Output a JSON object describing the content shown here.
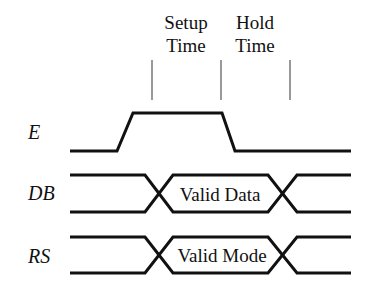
{
  "diagram": {
    "type": "timing-diagram",
    "colors": {
      "line": "#111111",
      "marker": "#555555",
      "background": "#ffffff"
    },
    "headers": {
      "setup": {
        "line1": "Setup",
        "line2": "Time"
      },
      "hold": {
        "line1": "Hold",
        "line2": "Time"
      }
    },
    "signals": [
      {
        "id": "E",
        "label": "E"
      },
      {
        "id": "DB",
        "label": "DB",
        "valid_label": "Valid Data"
      },
      {
        "id": "RS",
        "label": "RS",
        "valid_label": "Valid Mode"
      }
    ],
    "markers": [
      {
        "name": "setup-start"
      },
      {
        "name": "enable-falling-edge"
      },
      {
        "name": "hold-end"
      }
    ]
  }
}
